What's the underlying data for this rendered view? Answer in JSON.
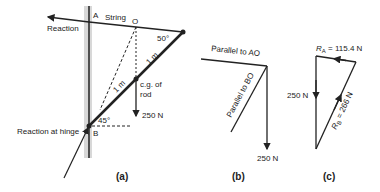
{
  "figure_a": {
    "caption": "(a)",
    "label_A": "A",
    "label_string": "String",
    "label_O": "O",
    "label_reaction": "Reaction",
    "angle_top": "50°",
    "len_upper": "1 m",
    "len_lower": "1 m",
    "cg_line1": "c.g. of",
    "cg_line2": "rod",
    "weight": "250 N",
    "angle_bottom": "45°",
    "label_B": "B",
    "hinge_reaction": "Reaction at hinge"
  },
  "figure_b": {
    "caption": "(b)",
    "parallel_ao": "Parallel to AO",
    "parallel_bo": "Parallel to BO",
    "weight": "250 N"
  },
  "figure_c": {
    "caption": "(c)",
    "ra_sym": "R",
    "ra_sub": "A",
    "ra_val": " = 115.4 N",
    "rb_label": "R",
    "rb_sub": "B",
    "rb_val": " = 266 N",
    "weight": "250 N"
  }
}
